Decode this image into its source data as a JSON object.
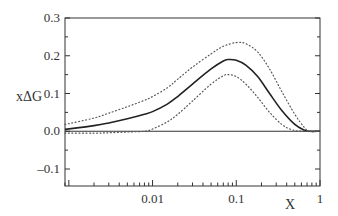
{
  "chart_data": {
    "type": "line",
    "title": "",
    "xlabel": "X",
    "ylabel": "xΔG",
    "xscale": "log",
    "xlim": [
      0.0009,
      1
    ],
    "ylim": [
      -0.145,
      0.3
    ],
    "grid": false,
    "legend": null,
    "x_ticks": [
      {
        "value": 0.01,
        "label": "0.01"
      },
      {
        "value": 0.1,
        "label": "0.1"
      },
      {
        "value": 1,
        "label": "1"
      }
    ],
    "y_ticks": [
      {
        "value": 0.3,
        "label": "0.3"
      },
      {
        "value": 0.2,
        "label": "0.2"
      },
      {
        "value": 0.1,
        "label": "0.1"
      },
      {
        "value": 0.0,
        "label": "0.0"
      },
      {
        "value": -0.1,
        "label": "–0.1"
      }
    ],
    "reference_lines": [
      {
        "y": 0,
        "style": "solid"
      }
    ],
    "series": [
      {
        "name": "central",
        "style": "solid",
        "x": [
          0.0009,
          0.002,
          0.003,
          0.005,
          0.008,
          0.01,
          0.015,
          0.02,
          0.03,
          0.05,
          0.07,
          0.08,
          0.1,
          0.13,
          0.18,
          0.25,
          0.35,
          0.5,
          0.65,
          0.75,
          1.0
        ],
        "values": [
          0.005,
          0.015,
          0.022,
          0.033,
          0.045,
          0.052,
          0.072,
          0.092,
          0.125,
          0.165,
          0.186,
          0.19,
          0.188,
          0.175,
          0.145,
          0.1,
          0.055,
          0.018,
          0.003,
          0.0,
          0.0
        ]
      },
      {
        "name": "upper-bound",
        "style": "dotted",
        "x": [
          0.0009,
          0.002,
          0.003,
          0.005,
          0.008,
          0.01,
          0.015,
          0.02,
          0.03,
          0.05,
          0.07,
          0.1,
          0.13,
          0.18,
          0.25,
          0.35,
          0.5,
          0.65,
          0.75,
          1.0
        ],
        "values": [
          0.018,
          0.035,
          0.048,
          0.065,
          0.082,
          0.092,
          0.115,
          0.138,
          0.17,
          0.205,
          0.225,
          0.235,
          0.232,
          0.21,
          0.165,
          0.105,
          0.045,
          0.01,
          0.0,
          0.0
        ]
      },
      {
        "name": "lower-bound",
        "style": "dotted",
        "x": [
          0.0009,
          0.002,
          0.003,
          0.005,
          0.008,
          0.01,
          0.015,
          0.02,
          0.03,
          0.05,
          0.07,
          0.08,
          0.1,
          0.13,
          0.18,
          0.25,
          0.35,
          0.45,
          0.6,
          1.0
        ],
        "values": [
          -0.005,
          -0.005,
          -0.004,
          -0.002,
          0.0,
          0.006,
          0.025,
          0.045,
          0.08,
          0.125,
          0.147,
          0.15,
          0.145,
          0.125,
          0.09,
          0.05,
          0.018,
          0.005,
          0.0,
          0.0
        ]
      }
    ]
  },
  "colors": {
    "axis": "#333333",
    "series_line": "#222222",
    "background": "#ffffff"
  }
}
